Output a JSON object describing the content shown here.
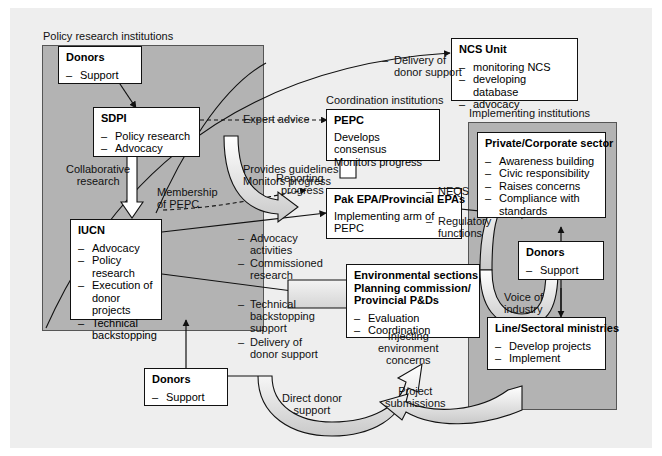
{
  "diagram": {
    "panels": [
      {
        "id": "policy-research",
        "label": "Policy research institutions"
      },
      {
        "id": "implementing",
        "label": "Implementing institutions"
      }
    ],
    "group_labels": {
      "coordination": "Coordination institutions"
    },
    "boxes": {
      "donors_top_left": {
        "title": "Donors",
        "items": [
          "Support"
        ]
      },
      "sdpi": {
        "title": "SDPI",
        "items": [
          "Policy research",
          "Advocacy"
        ]
      },
      "iucn": {
        "title": "IUCN",
        "items": [
          "Advocacy",
          "Policy research",
          "Execution of donor projects",
          "Technical backstopping"
        ]
      },
      "donors_bottom_left": {
        "title": "Donors",
        "items": [
          "Support"
        ]
      },
      "ncs_unit": {
        "title": "NCS Unit",
        "items": [
          "monitoring NCS",
          "developing database",
          "advocacy"
        ]
      },
      "pepc": {
        "title": "PEPC",
        "lines": [
          "Develops consensus",
          "Monitors progress"
        ]
      },
      "pak_epa": {
        "title": "Pak EPA/Provincial EPAs",
        "lines": [
          "Implementing arm of PEPC"
        ]
      },
      "environmental_sections": {
        "title_lines": [
          "Environmental sections",
          "Planning commission/",
          "Provincial P&Ds"
        ],
        "items": [
          "Evaluation",
          "Coordination"
        ]
      },
      "private_sector": {
        "title": "Private/Corporate sector",
        "items": [
          "Awareness building",
          "Civic responsibility",
          "Raises concerns",
          "Compliance with standards"
        ]
      },
      "donors_right": {
        "title": "Donors",
        "items": [
          "Support"
        ]
      },
      "line_ministries": {
        "title": "Line/Sectoral ministries",
        "items": [
          "Develop projects",
          "Implement"
        ]
      }
    },
    "edge_labels": {
      "delivery_of_donor_support": {
        "dash": "–",
        "lines": [
          "Delivery of",
          "donor support"
        ]
      },
      "expert_advice": {
        "lines": [
          "Expert advice"
        ]
      },
      "provides_guidelines": {
        "lines": [
          "Provides guidelines",
          "Monitors progress"
        ]
      },
      "collaborative_research": {
        "lines": [
          "Collaborative",
          "research"
        ]
      },
      "membership_of_pepc": {
        "lines": [
          "Membership",
          "of PEPC"
        ]
      },
      "reporting_progress": {
        "lines": [
          "Reporting",
          "progress"
        ]
      },
      "neqs": {
        "dash": "–",
        "lines": [
          "NEQS"
        ]
      },
      "regulatory_functions": {
        "dash": "–",
        "lines": [
          "Regulatory",
          "functions"
        ]
      },
      "advocacy_commissioned": {
        "items": [
          "Advocacy activities",
          "Commissioned research"
        ]
      },
      "technical_delivery": {
        "items": [
          "Technical backstopping support",
          "Delivery of donor support"
        ]
      },
      "injecting_environment_concerns": {
        "lines": [
          "Injecting",
          "environment",
          "concerns"
        ]
      },
      "voice_of_industry": {
        "lines": [
          "Voice of",
          "industry"
        ]
      },
      "direct_donor_support": {
        "lines": [
          "Direct donor",
          "support"
        ]
      },
      "project_submissions": {
        "lines": [
          "Project",
          "submissions"
        ]
      }
    },
    "colors": {
      "canvas": "#eeeeee",
      "panel_fill": "#b3b3b3",
      "box_fill": "#ffffff",
      "stroke": "#111111"
    }
  }
}
